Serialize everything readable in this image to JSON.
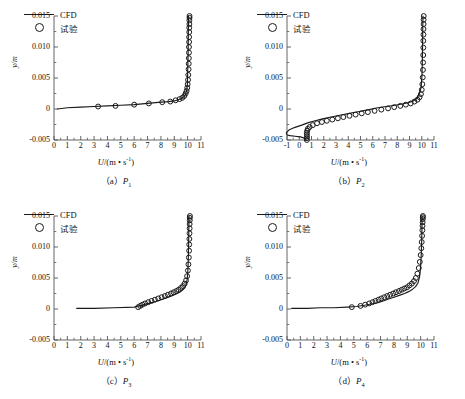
{
  "figure": {
    "background": "#ffffff",
    "line_color": "#1a1a1a",
    "marker_color": "#1a1a1a",
    "axis_color": "#555555"
  },
  "legend": {
    "cfd_label": "CFD",
    "exp_label": "试验",
    "cfd_key": "solid-line",
    "exp_key": "open-circle"
  },
  "axes": {
    "ylabel": "y/m",
    "xlabel_prefix": "U",
    "xlabel_rest": "/(m • s",
    "xlabel_sup": "-1",
    "xlabel_tail": ")",
    "yticks": [
      "0.015",
      "0.010",
      "0.005",
      "0",
      "-0.005"
    ],
    "ytick_values": [
      0.015,
      0.01,
      0.005,
      0,
      -0.005
    ],
    "ylim": [
      -0.005,
      0.015
    ]
  },
  "panels": [
    {
      "id": "a",
      "caption_prefix": "（a）",
      "caption_sym": "P",
      "caption_sub": "1",
      "xlim": [
        0,
        11
      ],
      "xticks": [
        "0",
        "1",
        "2",
        "3",
        "4",
        "5",
        "6",
        "7",
        "8",
        "9",
        "10",
        "11"
      ],
      "xtick_values": [
        0,
        1,
        2,
        3,
        4,
        5,
        6,
        7,
        8,
        9,
        10,
        11
      ]
    },
    {
      "id": "b",
      "caption_prefix": "（b）",
      "caption_sym": "P",
      "caption_sub": "2",
      "xlim": [
        -1,
        11
      ],
      "xticks": [
        "-1",
        "0",
        "1",
        "2",
        "3",
        "4",
        "5",
        "6",
        "7",
        "8",
        "9",
        "10",
        "11"
      ],
      "xtick_values": [
        -1,
        0,
        1,
        2,
        3,
        4,
        5,
        6,
        7,
        8,
        9,
        10,
        11
      ]
    },
    {
      "id": "c",
      "caption_prefix": "（c）",
      "caption_sym": "P",
      "caption_sub": "3",
      "xlim": [
        0,
        11
      ],
      "xticks": [
        "0",
        "1",
        "2",
        "3",
        "4",
        "5",
        "6",
        "7",
        "8",
        "9",
        "10",
        "11"
      ],
      "xtick_values": [
        0,
        1,
        2,
        3,
        4,
        5,
        6,
        7,
        8,
        9,
        10,
        11
      ]
    },
    {
      "id": "d",
      "caption_prefix": "（d）",
      "caption_sym": "P",
      "caption_sub": "4",
      "xlim": [
        0,
        11
      ],
      "xticks": [
        "0",
        "1",
        "2",
        "3",
        "4",
        "5",
        "6",
        "7",
        "8",
        "9",
        "10",
        "11"
      ],
      "xtick_values": [
        0,
        1,
        2,
        3,
        4,
        5,
        6,
        7,
        8,
        9,
        10,
        11
      ]
    }
  ],
  "chart_data": [
    {
      "type": "line",
      "panel": "a",
      "title": "(a) P1",
      "xlabel": "U/(m • s-1)",
      "ylabel": "y/m",
      "xlim": [
        0,
        11
      ],
      "ylim": [
        -0.005,
        0.015
      ],
      "grid": false,
      "legend_position": "upper-left-inside",
      "series": [
        {
          "name": "CFD",
          "style": "line",
          "x": [
            0.25,
            1.0,
            2.0,
            3.0,
            4.0,
            5.0,
            6.0,
            7.0,
            8.0,
            8.6,
            9.0,
            9.3,
            9.55,
            9.72,
            9.85,
            9.93,
            9.98,
            10.0,
            10.02,
            10.04,
            10.05,
            10.06,
            10.07
          ],
          "y": [
            0.0,
            0.0002,
            0.0003,
            0.0004,
            0.0005,
            0.0006,
            0.0007,
            0.0009,
            0.0011,
            0.0012,
            0.0013,
            0.0015,
            0.0017,
            0.002,
            0.0024,
            0.003,
            0.004,
            0.0055,
            0.0075,
            0.0095,
            0.0115,
            0.0135,
            0.015
          ]
        },
        {
          "name": "试验",
          "style": "markers",
          "x": [
            3.3,
            4.6,
            6.0,
            7.1,
            8.1,
            8.7,
            9.1,
            9.4,
            9.6,
            9.75,
            9.85,
            9.92,
            9.97,
            10.0,
            10.03,
            10.05,
            10.07,
            10.08,
            10.09,
            10.1,
            10.1,
            10.11,
            10.11,
            10.12,
            10.12,
            10.13,
            10.13,
            10.14,
            10.14
          ],
          "y": [
            0.0004,
            0.0005,
            0.0007,
            0.0009,
            0.0011,
            0.0012,
            0.0014,
            0.0016,
            0.0018,
            0.0021,
            0.0025,
            0.0029,
            0.0034,
            0.004,
            0.0047,
            0.0055,
            0.0064,
            0.0073,
            0.0082,
            0.0091,
            0.01,
            0.0108,
            0.0116,
            0.0124,
            0.0131,
            0.0137,
            0.0143,
            0.0147,
            0.015
          ]
        }
      ]
    },
    {
      "type": "line",
      "panel": "b",
      "title": "(b) P2",
      "xlabel": "U/(m • s-1)",
      "ylabel": "y/m",
      "xlim": [
        -1,
        11
      ],
      "ylim": [
        -0.005,
        0.015
      ],
      "grid": false,
      "legend_position": "upper-left-inside",
      "note": "separated flow: CFD curve loops to negative U below y=0",
      "series": [
        {
          "name": "CFD",
          "style": "line",
          "x": [
            0.55,
            0.4,
            0.1,
            -0.35,
            -0.75,
            -1.0,
            -1.05,
            -0.85,
            -0.4,
            0.2,
            0.75,
            1.3,
            1.9,
            2.6,
            3.3,
            4.1,
            4.9,
            5.7,
            6.4,
            7.1,
            7.8,
            8.4,
            8.9,
            9.3,
            9.6,
            9.8,
            9.95,
            10.02,
            10.05,
            10.07,
            10.08,
            10.09,
            10.1
          ],
          "y": [
            -0.005,
            -0.0047,
            -0.0045,
            -0.0044,
            -0.0043,
            -0.0042,
            -0.0038,
            -0.0034,
            -0.003,
            -0.0026,
            -0.0022,
            -0.0019,
            -0.0016,
            -0.0013,
            -0.001,
            -0.0007,
            -0.0004,
            -0.0001,
            0.0002,
            0.0004,
            0.0006,
            0.0008,
            0.001,
            0.0013,
            0.0017,
            0.0024,
            0.0035,
            0.0055,
            0.008,
            0.0105,
            0.0125,
            0.014,
            0.015
          ]
        },
        {
          "name": "试验",
          "style": "markers",
          "x": [
            0.62,
            0.62,
            0.62,
            0.62,
            0.62,
            0.65,
            0.7,
            0.85,
            1.1,
            1.45,
            1.85,
            2.25,
            2.7,
            3.15,
            3.6,
            4.1,
            4.6,
            5.1,
            5.6,
            6.15,
            6.7,
            7.25,
            7.75,
            8.25,
            8.7,
            9.1,
            9.4,
            9.65,
            9.82,
            9.93,
            10.0,
            10.05,
            10.08,
            10.1,
            10.11,
            10.12,
            10.13,
            10.13,
            10.14,
            10.14,
            10.15,
            10.15,
            10.16
          ],
          "y": [
            -0.005,
            -0.0047,
            -0.0044,
            -0.0041,
            -0.0038,
            -0.0035,
            -0.0032,
            -0.0029,
            -0.0026,
            -0.0023,
            -0.0021,
            -0.0019,
            -0.0017,
            -0.0015,
            -0.0013,
            -0.0011,
            -0.0009,
            -0.0007,
            -0.0005,
            -0.0003,
            -0.0001,
            0.0001,
            0.0003,
            0.0005,
            0.0007,
            0.0009,
            0.0012,
            0.0015,
            0.0019,
            0.0024,
            0.0031,
            0.004,
            0.0051,
            0.0063,
            0.0075,
            0.0087,
            0.0099,
            0.011,
            0.012,
            0.0129,
            0.0137,
            0.0144,
            0.015
          ]
        }
      ]
    },
    {
      "type": "line",
      "panel": "c",
      "title": "(c) P3",
      "xlabel": "U/(m • s-1)",
      "ylabel": "y/m",
      "xlim": [
        0,
        11
      ],
      "ylim": [
        -0.005,
        0.015
      ],
      "grid": false,
      "legend_position": "upper-left-inside",
      "series": [
        {
          "name": "CFD",
          "style": "line",
          "x": [
            1.7,
            3.0,
            4.5,
            6.0,
            6.6,
            7.1,
            7.6,
            8.0,
            8.4,
            8.8,
            9.1,
            9.4,
            9.6,
            9.78,
            9.9,
            9.98,
            10.03,
            10.06,
            10.08,
            10.09,
            10.1
          ],
          "y": [
            0.0001,
            0.0001,
            0.0002,
            0.0003,
            0.0006,
            0.0009,
            0.0012,
            0.0015,
            0.0018,
            0.0021,
            0.0024,
            0.0027,
            0.003,
            0.0034,
            0.004,
            0.005,
            0.0068,
            0.009,
            0.0112,
            0.0132,
            0.015
          ]
        },
        {
          "name": "试验",
          "style": "markers",
          "x": [
            6.3,
            6.45,
            6.62,
            6.82,
            7.05,
            7.3,
            7.55,
            7.8,
            8.05,
            8.3,
            8.52,
            8.75,
            8.95,
            9.15,
            9.32,
            9.5,
            9.65,
            9.78,
            9.88,
            9.96,
            10.02,
            10.06,
            10.09,
            10.11,
            10.12,
            10.13,
            10.14,
            10.15,
            10.15,
            10.16,
            10.16,
            10.17
          ],
          "y": [
            0.0003,
            0.0005,
            0.0007,
            0.0009,
            0.0011,
            0.0013,
            0.0015,
            0.0017,
            0.0019,
            0.0021,
            0.0023,
            0.0025,
            0.0027,
            0.0029,
            0.0031,
            0.0034,
            0.0037,
            0.0041,
            0.0046,
            0.0053,
            0.0062,
            0.0072,
            0.0083,
            0.0094,
            0.0104,
            0.0113,
            0.0122,
            0.013,
            0.0137,
            0.0143,
            0.0147,
            0.015
          ]
        }
      ]
    },
    {
      "type": "line",
      "panel": "d",
      "title": "(d) P4",
      "xlabel": "U/(m • s-1)",
      "ylabel": "y/m",
      "xlim": [
        0,
        11
      ],
      "ylim": [
        -0.005,
        0.015
      ],
      "grid": false,
      "legend_position": "upper-left-inside",
      "series": [
        {
          "name": "CFD",
          "style": "line",
          "x": [
            0.35,
            1.5,
            2.5,
            3.5,
            4.5,
            5.2,
            5.8,
            6.3,
            6.8,
            7.2,
            7.6,
            8.0,
            8.4,
            8.8,
            9.1,
            9.4,
            9.62,
            9.8,
            9.92,
            10.0,
            10.05,
            10.08,
            10.1,
            10.11
          ],
          "y": [
            0.0001,
            0.0001,
            0.0002,
            0.0002,
            0.0003,
            0.0004,
            0.0006,
            0.0008,
            0.001,
            0.0013,
            0.0016,
            0.0019,
            0.0022,
            0.0025,
            0.0028,
            0.0032,
            0.0036,
            0.0042,
            0.0052,
            0.0068,
            0.009,
            0.0112,
            0.0133,
            0.015
          ]
        },
        {
          "name": "试验",
          "style": "markers",
          "x": [
            4.85,
            5.5,
            5.85,
            6.15,
            6.4,
            6.62,
            6.85,
            7.05,
            7.28,
            7.5,
            7.72,
            7.95,
            8.15,
            8.38,
            8.58,
            8.78,
            8.98,
            9.16,
            9.34,
            9.5,
            9.64,
            9.76,
            9.86,
            9.94,
            10.0,
            10.05,
            10.08,
            10.11,
            10.13,
            10.14,
            10.15,
            10.16,
            10.16,
            10.17
          ],
          "y": [
            0.0003,
            0.0005,
            0.0007,
            0.0009,
            0.0011,
            0.0013,
            0.0015,
            0.0017,
            0.0019,
            0.0021,
            0.0023,
            0.0025,
            0.0027,
            0.0029,
            0.0031,
            0.0033,
            0.0035,
            0.0038,
            0.0041,
            0.0045,
            0.005,
            0.0057,
            0.0066,
            0.0076,
            0.0087,
            0.0098,
            0.0108,
            0.0118,
            0.0127,
            0.0134,
            0.014,
            0.0145,
            0.0148,
            0.015
          ]
        }
      ]
    }
  ]
}
